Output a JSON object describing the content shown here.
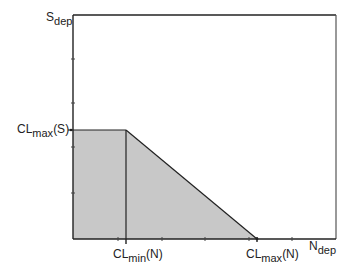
{
  "diagram": {
    "type": "region-plot",
    "axes": {
      "y_label": {
        "base": "S",
        "sub": "dep"
      },
      "x_label": {
        "base": "N",
        "sub": "dep"
      }
    },
    "markers": {
      "y_marker": {
        "base": "CL",
        "sub": "max",
        "suffix": "(S)"
      },
      "x_marker_min": {
        "base": "CL",
        "sub": "min",
        "suffix": "(N)"
      },
      "x_marker_max": {
        "base": "CL",
        "sub": "max",
        "suffix": "(N)"
      }
    },
    "region": {
      "description": "Shaded feasible region bounded by axes, horizontal line at CLmax(S) until CLmin(N), then diagonal down to CLmax(N)",
      "fill_color": "#c8c8c8",
      "stroke_color": "#222222"
    },
    "frame_color": "#222222"
  }
}
